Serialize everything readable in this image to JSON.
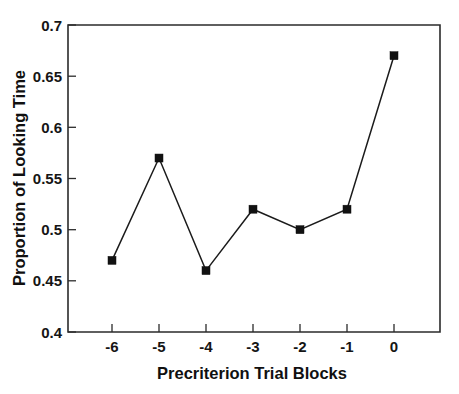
{
  "chart_data": {
    "type": "line",
    "title": "",
    "xlabel": "Precriterion Trial Blocks",
    "ylabel": "Proportion of Looking Time",
    "x": [
      -6,
      -5,
      -4,
      -3,
      -2,
      -1,
      0
    ],
    "values": [
      0.47,
      0.57,
      0.46,
      0.52,
      0.5,
      0.52,
      0.67
    ],
    "series": [
      {
        "name": "Proportion of Looking Time",
        "values": [
          0.47,
          0.57,
          0.46,
          0.52,
          0.5,
          0.52,
          0.67
        ]
      }
    ],
    "xtick_labels": [
      "-6",
      "-5",
      "-4",
      "-3",
      "-2",
      "-1",
      "0"
    ],
    "ytick_labels": [
      "0.4",
      "0.45",
      "0.5",
      "0.55",
      "0.6",
      "0.65",
      "0.7"
    ],
    "yticks": [
      0.4,
      0.45,
      0.5,
      0.55,
      0.6,
      0.65,
      0.7
    ],
    "xlim": [
      -6.6,
      0.65
    ],
    "ylim": [
      0.4,
      0.7
    ],
    "grid": false,
    "legend": "none",
    "marker": "square",
    "line_color": "#1b1b1b",
    "marker_color": "#111111",
    "background_color": "#ffffff",
    "axis_color": "#2b2b2b"
  }
}
